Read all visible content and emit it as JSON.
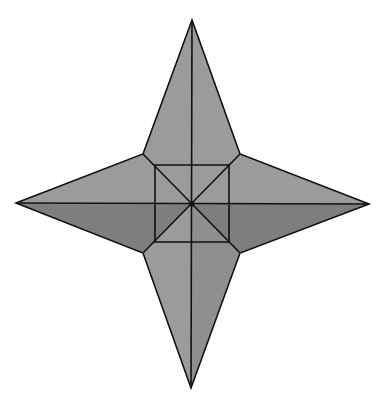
{
  "diagram": {
    "title": "Four-pointed star with inscribed central square",
    "canvas": {
      "width": 383,
      "height": 405
    },
    "colors": {
      "background": "#ffffff",
      "light_face": "#9b9b9b",
      "mid_face": "#8f8f8f",
      "dark_face": "#7e7e7e",
      "stroke": "#111111"
    },
    "stroke_width": 1.6,
    "center": [
      192,
      204
    ],
    "outer_points": {
      "top": [
        192,
        20
      ],
      "right": [
        369,
        204
      ],
      "bottom": [
        191,
        388
      ],
      "left": [
        16,
        203
      ]
    },
    "inner_vertices": {
      "upper_left": [
        143,
        154
      ],
      "upper_right": [
        240,
        154
      ],
      "lower_right": [
        240,
        253
      ],
      "lower_left": [
        143,
        253
      ]
    },
    "square": {
      "top_left": [
        155,
        165
      ],
      "top_right": [
        229,
        165
      ],
      "bottom_right": [
        229,
        242
      ],
      "bottom_left": [
        155,
        242
      ]
    },
    "faces": [
      {
        "name": "top-arm-left",
        "shade": "light_face",
        "points": [
          [
            192,
            20
          ],
          [
            143,
            154
          ],
          [
            155,
            165
          ],
          [
            192,
            165
          ]
        ]
      },
      {
        "name": "top-arm-right",
        "shade": "light_face",
        "points": [
          [
            192,
            20
          ],
          [
            240,
            154
          ],
          [
            229,
            165
          ],
          [
            192,
            165
          ]
        ]
      },
      {
        "name": "right-arm-upper",
        "shade": "light_face",
        "points": [
          [
            369,
            204
          ],
          [
            240,
            154
          ],
          [
            229,
            165
          ],
          [
            229,
            204
          ]
        ]
      },
      {
        "name": "right-arm-lower",
        "shade": "dark_face",
        "points": [
          [
            369,
            204
          ],
          [
            240,
            253
          ],
          [
            229,
            242
          ],
          [
            229,
            204
          ]
        ]
      },
      {
        "name": "bottom-arm-right",
        "shade": "mid_face",
        "points": [
          [
            191,
            388
          ],
          [
            240,
            253
          ],
          [
            229,
            242
          ],
          [
            192,
            242
          ]
        ]
      },
      {
        "name": "bottom-arm-left",
        "shade": "light_face",
        "points": [
          [
            191,
            388
          ],
          [
            143,
            253
          ],
          [
            155,
            242
          ],
          [
            192,
            242
          ]
        ]
      },
      {
        "name": "left-arm-lower",
        "shade": "dark_face",
        "points": [
          [
            16,
            203
          ],
          [
            143,
            253
          ],
          [
            155,
            242
          ],
          [
            155,
            204
          ]
        ]
      },
      {
        "name": "left-arm-upper",
        "shade": "light_face",
        "points": [
          [
            16,
            203
          ],
          [
            143,
            154
          ],
          [
            155,
            165
          ],
          [
            155,
            204
          ]
        ]
      },
      {
        "name": "square-top-left",
        "shade": "light_face",
        "points": [
          [
            155,
            165
          ],
          [
            192,
            165
          ],
          [
            192,
            204
          ]
        ]
      },
      {
        "name": "square-top-left-b",
        "shade": "light_face",
        "points": [
          [
            155,
            165
          ],
          [
            155,
            204
          ],
          [
            192,
            204
          ]
        ]
      },
      {
        "name": "square-top-right",
        "shade": "light_face",
        "points": [
          [
            229,
            165
          ],
          [
            192,
            165
          ],
          [
            192,
            204
          ]
        ]
      },
      {
        "name": "square-top-right-b",
        "shade": "light_face",
        "points": [
          [
            229,
            165
          ],
          [
            229,
            204
          ],
          [
            192,
            204
          ]
        ]
      },
      {
        "name": "square-bottom-right",
        "shade": "dark_face",
        "points": [
          [
            229,
            242
          ],
          [
            229,
            204
          ],
          [
            192,
            204
          ]
        ]
      },
      {
        "name": "square-bottom-right-b",
        "shade": "mid_face",
        "points": [
          [
            229,
            242
          ],
          [
            192,
            242
          ],
          [
            192,
            204
          ]
        ]
      },
      {
        "name": "square-bottom-left",
        "shade": "dark_face",
        "points": [
          [
            155,
            242
          ],
          [
            155,
            204
          ],
          [
            192,
            204
          ]
        ]
      },
      {
        "name": "square-bottom-left-b",
        "shade": "light_face",
        "points": [
          [
            155,
            242
          ],
          [
            192,
            242
          ],
          [
            192,
            204
          ]
        ]
      }
    ],
    "lines": [
      {
        "name": "vertical-axis",
        "from": [
          192,
          20
        ],
        "to": [
          191,
          388
        ]
      },
      {
        "name": "horizontal-axis",
        "from": [
          16,
          203
        ],
        "to": [
          369,
          204
        ]
      },
      {
        "name": "diagonal-tl-br",
        "from": [
          143,
          154
        ],
        "to": [
          240,
          253
        ]
      },
      {
        "name": "diagonal-tr-bl",
        "from": [
          240,
          154
        ],
        "to": [
          143,
          253
        ]
      }
    ],
    "outline": [
      [
        192,
        20
      ],
      [
        240,
        154
      ],
      [
        369,
        204
      ],
      [
        240,
        253
      ],
      [
        191,
        388
      ],
      [
        143,
        253
      ],
      [
        16,
        203
      ],
      [
        143,
        154
      ]
    ],
    "square_outline": [
      [
        155,
        165
      ],
      [
        229,
        165
      ],
      [
        229,
        242
      ],
      [
        155,
        242
      ]
    ],
    "center_dot_radius": 2.5
  }
}
